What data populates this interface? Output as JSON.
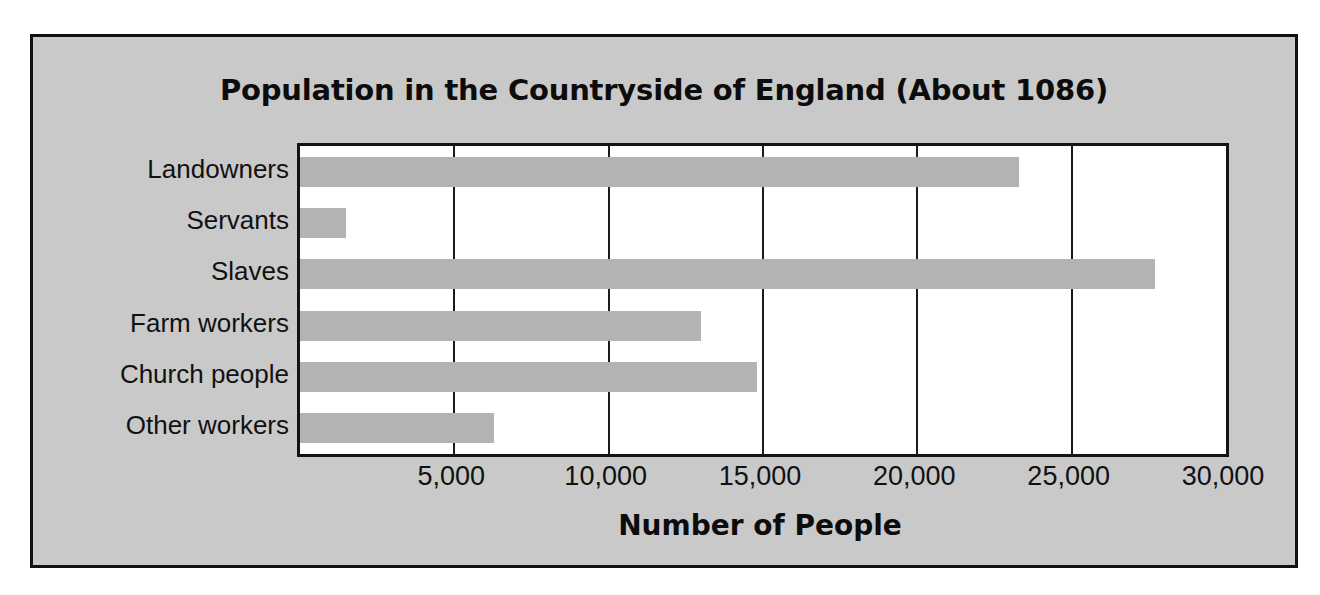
{
  "figure": {
    "background_color": "#c9c9c9",
    "frame_color": "#111111",
    "plot_background_color": "#ffffff"
  },
  "chart_data": {
    "type": "bar",
    "orientation": "horizontal",
    "title": "Population in the Countryside of England (About 1086)",
    "xlabel": "Number of People",
    "ylabel": "",
    "categories": [
      "Landowners",
      "Servants",
      "Slaves",
      "Farm workers",
      "Church people",
      "Other workers"
    ],
    "values": [
      23300,
      1500,
      27700,
      13000,
      14800,
      6300
    ],
    "xlim": [
      0,
      30000
    ],
    "xticks": [
      5000,
      10000,
      15000,
      20000,
      25000,
      30000
    ],
    "xtick_labels": [
      "5,000",
      "10,000",
      "15,000",
      "20,000",
      "25,000",
      "30,000"
    ],
    "grid": "vertical",
    "legend": "none",
    "bar_color": "#b3b3b3",
    "gridline_color": "#1b1b1b"
  }
}
